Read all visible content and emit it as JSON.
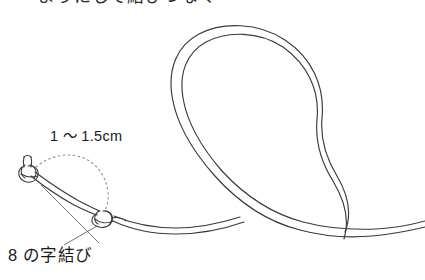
{
  "figure": {
    "title_partial": "ようにして結びつなぐ",
    "background_color": "#ffffff",
    "line_color": "#3a3a3a",
    "dotted_color": "#7a7a7a",
    "leader_color": "#5a5a5a"
  },
  "labels": {
    "measurement": "1 〜 1.5cm",
    "knot_name": "8 の字結び"
  },
  "annotations": {
    "measurement_arc": "dotted-arc-between-knots",
    "leader_line_left": "leader-to-end-knot",
    "leader_line_right": "leader-to-figure-eight-knot"
  },
  "parts": {
    "cord_loop": "large-circular-loop",
    "cord_crossing": "cord-crossing-point",
    "knot_end": "end-knot",
    "knot_figure_eight": "figure-eight-knot",
    "tail_upper": "upper-cord-tail",
    "tail_lower": "lower-cord-tail"
  }
}
